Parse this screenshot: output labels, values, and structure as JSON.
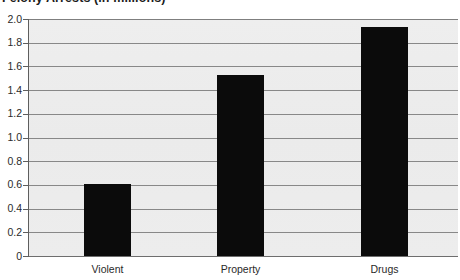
{
  "chart_data": {
    "type": "bar",
    "title": "Felony Arrests (in millions)",
    "xlabel": "",
    "ylabel": "",
    "categories": [
      "Violent",
      "Property",
      "Drugs"
    ],
    "values": [
      0.61,
      1.53,
      1.93
    ],
    "ylim": [
      0,
      2.0
    ],
    "ytick_step": 0.2,
    "ytick_labels": [
      "2.0",
      "1.8",
      "1.6",
      "1.4",
      "1.2",
      "1.0",
      "0.8",
      "0.6",
      "0.4",
      "0.2",
      "0"
    ],
    "ytick_values": [
      2.0,
      1.8,
      1.6,
      1.4,
      1.2,
      1.0,
      0.8,
      0.6,
      0.4,
      0.2,
      0
    ],
    "grid": true,
    "grid_orientation": "horizontal",
    "legend": false,
    "legend_position": "none",
    "series": [
      {
        "name": "Felony Arrests",
        "values": [
          0.61,
          1.53,
          1.93
        ]
      }
    ],
    "colors": {
      "bar": "#0b0b0b",
      "plot_background": "#ececec",
      "gridline": "#888888",
      "axis": "#5e5e5e",
      "text": "#2a2a2a",
      "title": "#1b1b1b"
    }
  }
}
